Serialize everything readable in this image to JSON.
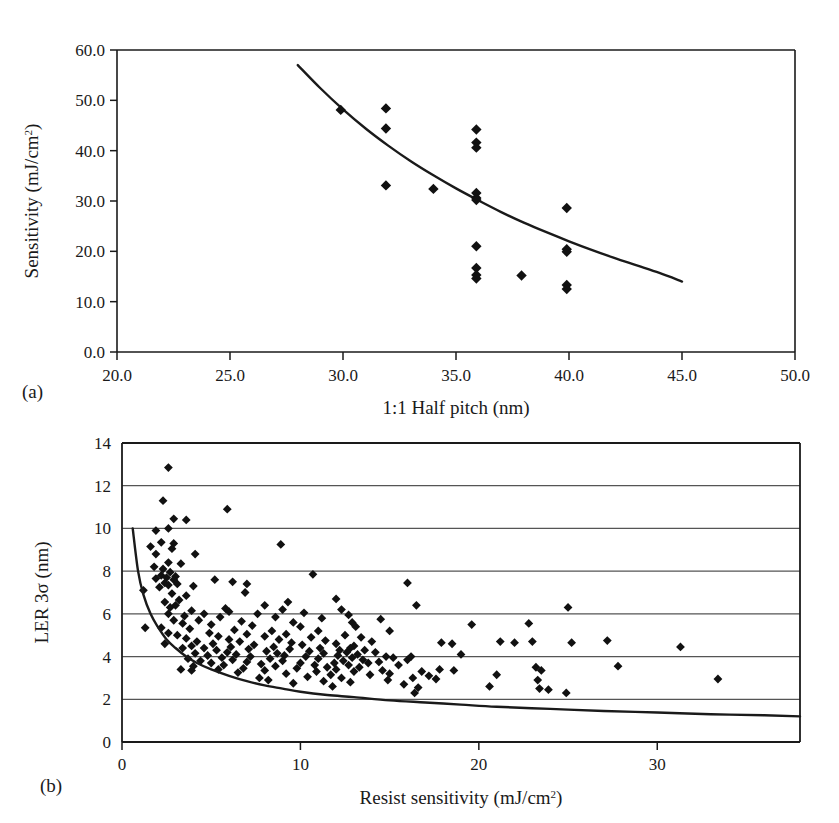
{
  "figure": {
    "panels": [
      {
        "tag": "(a)",
        "xlabel": "1:1 Half pitch (nm)",
        "ylabel": "Sensitivity (mJ/cm2)",
        "ylabel_base": "Sensitivity (mJ/cm",
        "ylabel_sup": "2",
        "ylabel_tail": ")"
      },
      {
        "tag": "(b)",
        "xlabel": "Resist sensitivity (mJ/cm2)",
        "xlabel_base": "Resist sensitivity (mJ/cm",
        "xlabel_sup": "2",
        "xlabel_tail": ")",
        "ylabel": "LER 3σ (nm)"
      }
    ],
    "ink_color": "#1a1a1a",
    "marker_color": "#111111",
    "grid_color": "#555555",
    "background": "#ffffff"
  },
  "chart_data": [
    {
      "panel": "a",
      "type": "scatter",
      "title": "",
      "xlabel": "1:1 Half pitch (nm)",
      "ylabel": "Sensitivity (mJ/cm^2)",
      "xlim": [
        20.0,
        50.0
      ],
      "ylim": [
        0.0,
        60.0
      ],
      "xticks": [
        20.0,
        25.0,
        30.0,
        35.0,
        40.0,
        45.0,
        50.0
      ],
      "xtick_labels": [
        "20.0",
        "25.0",
        "30.0",
        "35.0",
        "40.0",
        "45.0",
        "50.0"
      ],
      "yticks": [
        0.0,
        10.0,
        20.0,
        30.0,
        40.0,
        50.0,
        60.0
      ],
      "ytick_labels": [
        "0.0",
        "10.0",
        "20.0",
        "30.0",
        "40.0",
        "50.0",
        "60.0"
      ],
      "grid": false,
      "legend": "none",
      "marker": "diamond",
      "points": [
        [
          29.9,
          48.1
        ],
        [
          31.9,
          48.4
        ],
        [
          31.9,
          44.4
        ],
        [
          31.9,
          33.1
        ],
        [
          34.0,
          32.4
        ],
        [
          35.9,
          44.2
        ],
        [
          35.9,
          41.6
        ],
        [
          35.9,
          40.6
        ],
        [
          35.9,
          31.6
        ],
        [
          35.9,
          30.6
        ],
        [
          35.9,
          30.2
        ],
        [
          35.9,
          21.0
        ],
        [
          35.9,
          16.7
        ],
        [
          35.9,
          15.3
        ],
        [
          35.9,
          14.6
        ],
        [
          37.9,
          15.2
        ],
        [
          39.9,
          28.6
        ],
        [
          39.9,
          20.4
        ],
        [
          39.9,
          19.9
        ],
        [
          39.9,
          13.3
        ],
        [
          39.9,
          12.5
        ]
      ],
      "trend_curve": {
        "description": "decaying fit curve from (28, 57) to (45, 14)",
        "points": [
          [
            28.0,
            57.0
          ],
          [
            29.0,
            52.4
          ],
          [
            30.0,
            48.2
          ],
          [
            31.0,
            44.4
          ],
          [
            32.0,
            41.0
          ],
          [
            33.0,
            37.9
          ],
          [
            34.0,
            35.1
          ],
          [
            35.0,
            32.5
          ],
          [
            36.0,
            30.1
          ],
          [
            37.0,
            27.8
          ],
          [
            38.0,
            25.7
          ],
          [
            39.0,
            23.8
          ],
          [
            40.0,
            22.0
          ],
          [
            41.0,
            20.3
          ],
          [
            42.0,
            18.7
          ],
          [
            43.0,
            17.2
          ],
          [
            44.0,
            15.7
          ],
          [
            45.0,
            14.0
          ]
        ]
      }
    },
    {
      "panel": "b",
      "type": "scatter",
      "title": "",
      "xlabel": "Resist sensitivity (mJ/cm^2)",
      "ylabel": "LER 3σ (nm)",
      "xlim": [
        0,
        38
      ],
      "ylim": [
        0,
        14
      ],
      "xticks": [
        0,
        10,
        20,
        30
      ],
      "xtick_labels": [
        "0",
        "10",
        "20",
        "30"
      ],
      "yticks": [
        0,
        2,
        4,
        6,
        8,
        10,
        12,
        14
      ],
      "ytick_labels": [
        "0",
        "2",
        "4",
        "6",
        "8",
        "10",
        "12",
        "14"
      ],
      "grid": true,
      "grid_orientation": "horizontal",
      "legend": "none",
      "marker": "diamond",
      "points": [
        [
          2.6,
          12.85
        ],
        [
          2.3,
          11.3
        ],
        [
          5.9,
          10.9
        ],
        [
          2.9,
          10.45
        ],
        [
          3.6,
          10.4
        ],
        [
          2.6,
          10.0
        ],
        [
          1.9,
          9.9
        ],
        [
          8.9,
          9.25
        ],
        [
          2.2,
          9.35
        ],
        [
          2.9,
          9.3
        ],
        [
          1.6,
          9.15
        ],
        [
          2.8,
          9.05
        ],
        [
          1.9,
          8.8
        ],
        [
          4.1,
          8.8
        ],
        [
          2.6,
          8.4
        ],
        [
          3.3,
          8.35
        ],
        [
          1.8,
          8.2
        ],
        [
          2.3,
          8.1
        ],
        [
          2.7,
          7.95
        ],
        [
          10.7,
          7.85
        ],
        [
          2.2,
          7.8
        ],
        [
          3.0,
          7.75
        ],
        [
          2.5,
          7.7
        ],
        [
          1.9,
          7.65
        ],
        [
          2.9,
          7.6
        ],
        [
          5.2,
          7.6
        ],
        [
          16.0,
          7.45
        ],
        [
          6.2,
          7.5
        ],
        [
          2.4,
          7.45
        ],
        [
          3.1,
          7.4
        ],
        [
          7.0,
          7.4
        ],
        [
          2.6,
          7.35
        ],
        [
          4.0,
          7.3
        ],
        [
          2.1,
          7.25
        ],
        [
          1.2,
          7.1
        ],
        [
          6.9,
          7.0
        ],
        [
          2.8,
          6.95
        ],
        [
          3.6,
          6.85
        ],
        [
          12.0,
          6.7
        ],
        [
          3.2,
          6.65
        ],
        [
          2.4,
          6.55
        ],
        [
          9.3,
          6.55
        ],
        [
          25.0,
          6.3
        ],
        [
          16.5,
          6.4
        ],
        [
          8.0,
          6.4
        ],
        [
          3.0,
          6.4
        ],
        [
          2.7,
          6.3
        ],
        [
          5.8,
          6.25
        ],
        [
          9.0,
          6.2
        ],
        [
          12.3,
          6.2
        ],
        [
          3.9,
          6.15
        ],
        [
          6.0,
          6.1
        ],
        [
          10.2,
          6.05
        ],
        [
          2.6,
          6.0
        ],
        [
          4.6,
          6.0
        ],
        [
          7.6,
          6.0
        ],
        [
          12.7,
          5.95
        ],
        [
          3.5,
          5.9
        ],
        [
          5.5,
          5.85
        ],
        [
          8.6,
          5.85
        ],
        [
          11.2,
          5.8
        ],
        [
          14.5,
          5.75
        ],
        [
          2.9,
          5.7
        ],
        [
          4.3,
          5.7
        ],
        [
          6.7,
          5.65
        ],
        [
          9.6,
          5.6
        ],
        [
          12.9,
          5.6
        ],
        [
          19.6,
          5.5
        ],
        [
          22.8,
          5.55
        ],
        [
          3.4,
          5.55
        ],
        [
          5.0,
          5.5
        ],
        [
          7.3,
          5.45
        ],
        [
          10.0,
          5.4
        ],
        [
          13.1,
          5.4
        ],
        [
          15.0,
          5.2
        ],
        [
          1.3,
          5.35
        ],
        [
          3.8,
          5.3
        ],
        [
          6.3,
          5.25
        ],
        [
          8.4,
          5.2
        ],
        [
          11.0,
          5.2
        ],
        [
          2.6,
          5.1
        ],
        [
          4.9,
          5.1
        ],
        [
          7.0,
          5.05
        ],
        [
          9.2,
          5.05
        ],
        [
          12.5,
          5.0
        ],
        [
          3.1,
          5.0
        ],
        [
          5.4,
          4.95
        ],
        [
          8.0,
          4.95
        ],
        [
          10.6,
          4.9
        ],
        [
          13.4,
          4.9
        ],
        [
          21.2,
          4.7
        ],
        [
          22.0,
          4.65
        ],
        [
          23.0,
          4.7
        ],
        [
          25.2,
          4.65
        ],
        [
          27.2,
          4.75
        ],
        [
          3.6,
          4.85
        ],
        [
          6.0,
          4.8
        ],
        [
          8.8,
          4.8
        ],
        [
          11.4,
          4.75
        ],
        [
          14.0,
          4.7
        ],
        [
          31.3,
          4.45
        ],
        [
          4.2,
          4.7
        ],
        [
          6.6,
          4.7
        ],
        [
          9.5,
          4.65
        ],
        [
          12.0,
          4.6
        ],
        [
          2.4,
          4.6
        ],
        [
          5.1,
          4.6
        ],
        [
          7.4,
          4.55
        ],
        [
          10.1,
          4.55
        ],
        [
          13.0,
          4.5
        ],
        [
          3.9,
          4.5
        ],
        [
          6.1,
          4.45
        ],
        [
          8.5,
          4.45
        ],
        [
          11.1,
          4.4
        ],
        [
          12.8,
          4.4
        ],
        [
          17.9,
          4.65
        ],
        [
          18.5,
          4.6
        ],
        [
          19.0,
          4.1
        ],
        [
          16.2,
          4.0
        ],
        [
          4.6,
          4.4
        ],
        [
          7.1,
          4.35
        ],
        [
          9.4,
          4.35
        ],
        [
          12.2,
          4.3
        ],
        [
          13.6,
          4.3
        ],
        [
          5.3,
          4.3
        ],
        [
          8.1,
          4.25
        ],
        [
          10.5,
          4.25
        ],
        [
          12.6,
          4.2
        ],
        [
          14.2,
          4.2
        ],
        [
          3.4,
          4.4
        ],
        [
          5.9,
          4.2
        ],
        [
          8.7,
          4.15
        ],
        [
          11.3,
          4.15
        ],
        [
          13.2,
          4.1
        ],
        [
          4.1,
          4.15
        ],
        [
          6.4,
          4.1
        ],
        [
          9.1,
          4.05
        ],
        [
          12.1,
          4.05
        ],
        [
          14.8,
          4.0
        ],
        [
          4.8,
          4.05
        ],
        [
          7.2,
          4.0
        ],
        [
          10.3,
          4.0
        ],
        [
          12.9,
          3.95
        ],
        [
          15.2,
          3.95
        ],
        [
          5.6,
          3.95
        ],
        [
          8.3,
          3.9
        ],
        [
          11.0,
          3.9
        ],
        [
          13.5,
          3.85
        ],
        [
          16.0,
          3.85
        ],
        [
          3.7,
          3.9
        ],
        [
          6.2,
          3.85
        ],
        [
          9.0,
          3.8
        ],
        [
          12.4,
          3.8
        ],
        [
          14.4,
          3.75
        ],
        [
          4.4,
          3.8
        ],
        [
          7.0,
          3.75
        ],
        [
          10.0,
          3.7
        ],
        [
          11.9,
          3.7
        ],
        [
          13.8,
          3.7
        ],
        [
          27.8,
          3.55
        ],
        [
          5.0,
          3.7
        ],
        [
          7.8,
          3.65
        ],
        [
          10.8,
          3.6
        ],
        [
          12.7,
          3.6
        ],
        [
          15.5,
          3.6
        ],
        [
          23.2,
          3.5
        ],
        [
          23.5,
          3.35
        ],
        [
          17.8,
          3.4
        ],
        [
          18.6,
          3.35
        ],
        [
          5.7,
          3.6
        ],
        [
          8.6,
          3.55
        ],
        [
          11.5,
          3.5
        ],
        [
          13.3,
          3.5
        ],
        [
          16.8,
          3.3
        ],
        [
          4.0,
          3.55
        ],
        [
          6.8,
          3.45
        ],
        [
          9.8,
          3.45
        ],
        [
          12.0,
          3.4
        ],
        [
          14.6,
          3.35
        ],
        [
          21.0,
          3.15
        ],
        [
          33.4,
          2.95
        ],
        [
          5.4,
          3.4
        ],
        [
          8.0,
          3.35
        ],
        [
          10.9,
          3.3
        ],
        [
          13.0,
          3.3
        ],
        [
          15.0,
          3.2
        ],
        [
          17.2,
          3.1
        ],
        [
          17.6,
          2.95
        ],
        [
          23.3,
          2.9
        ],
        [
          6.5,
          3.25
        ],
        [
          9.2,
          3.2
        ],
        [
          11.7,
          3.15
        ],
        [
          13.9,
          3.15
        ],
        [
          16.3,
          3.0
        ],
        [
          7.7,
          3.0
        ],
        [
          10.4,
          3.05
        ],
        [
          12.3,
          3.0
        ],
        [
          14.9,
          2.9
        ],
        [
          20.6,
          2.6
        ],
        [
          8.2,
          2.9
        ],
        [
          11.3,
          2.85
        ],
        [
          12.8,
          2.8
        ],
        [
          15.8,
          2.7
        ],
        [
          23.4,
          2.5
        ],
        [
          23.9,
          2.45
        ],
        [
          9.6,
          2.75
        ],
        [
          11.8,
          2.6
        ],
        [
          16.6,
          2.55
        ],
        [
          16.4,
          2.3
        ],
        [
          24.9,
          2.3
        ],
        [
          2.2,
          5.35
        ],
        [
          3.3,
          3.4
        ],
        [
          3.9,
          3.35
        ]
      ],
      "trend_curve": {
        "description": "lower-bound decaying curve from (0.6, 10) toward (38, 1.2)",
        "points": [
          [
            0.6,
            10.0
          ],
          [
            0.9,
            8.0
          ],
          [
            1.2,
            6.9
          ],
          [
            1.6,
            6.0
          ],
          [
            2.0,
            5.4
          ],
          [
            2.5,
            4.8
          ],
          [
            3.0,
            4.4
          ],
          [
            3.6,
            4.0
          ],
          [
            4.2,
            3.7
          ],
          [
            5.0,
            3.4
          ],
          [
            6.0,
            3.1
          ],
          [
            7.0,
            2.85
          ],
          [
            8.0,
            2.65
          ],
          [
            9.0,
            2.5
          ],
          [
            10.0,
            2.35
          ],
          [
            11.5,
            2.2
          ],
          [
            13.0,
            2.1
          ],
          [
            15.0,
            1.95
          ],
          [
            17.0,
            1.85
          ],
          [
            19.0,
            1.75
          ],
          [
            21.0,
            1.65
          ],
          [
            24.0,
            1.55
          ],
          [
            27.0,
            1.45
          ],
          [
            30.0,
            1.38
          ],
          [
            33.0,
            1.3
          ],
          [
            36.0,
            1.25
          ],
          [
            38.0,
            1.2
          ]
        ]
      }
    }
  ]
}
